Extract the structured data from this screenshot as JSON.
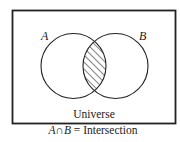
{
  "diagram": {
    "type": "venn",
    "universe_label": "Universe",
    "sets": [
      {
        "name": "A",
        "label": "A"
      },
      {
        "name": "B",
        "label": "B"
      }
    ],
    "shaded_region": "A∩B",
    "caption": {
      "set_a": "A",
      "operator": "∩",
      "set_b": "B",
      "rest": " = Intersection"
    },
    "colors": {
      "stroke": "#222222",
      "background": "#ffffff"
    }
  }
}
